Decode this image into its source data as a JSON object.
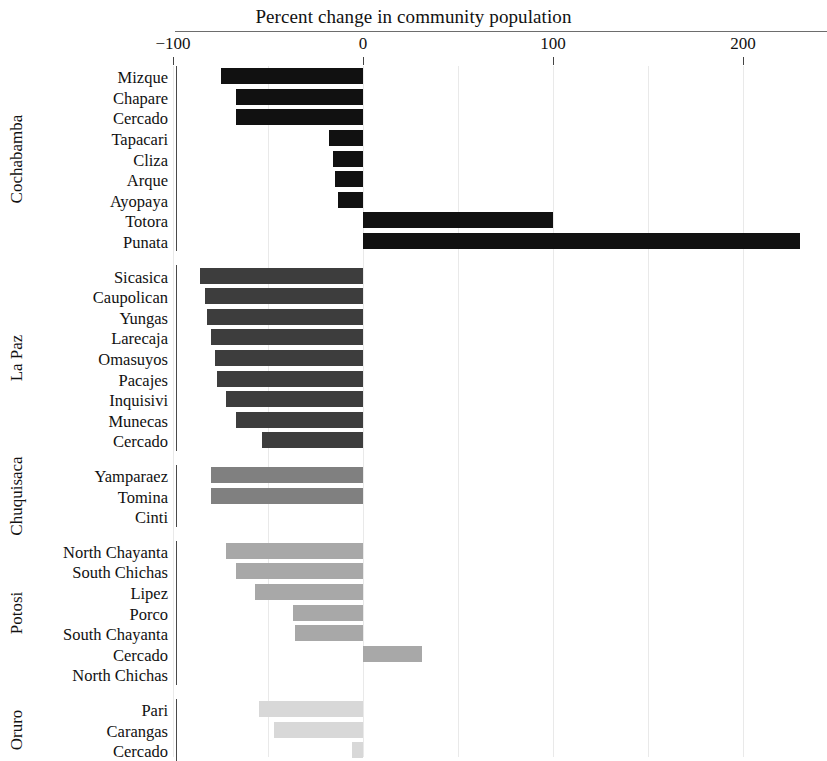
{
  "chart_data": {
    "type": "bar",
    "orientation": "horizontal",
    "title": "Percent change in community population",
    "xlabel": "",
    "ylabel": "",
    "xlim": [
      -100,
      240
    ],
    "xticks": [
      -100,
      0,
      100,
      200
    ],
    "xtick_labels": [
      "−100",
      "0",
      "100",
      "200"
    ],
    "grid": true,
    "grid_axis": "x",
    "legend": "none",
    "groups": [
      {
        "name": "Cochabamba",
        "color": "#111111",
        "categories": [
          "Mizque",
          "Chapare",
          "Cercado",
          "Tapacari",
          "Cliza",
          "Arque",
          "Ayopaya",
          "Totora",
          "Punata"
        ],
        "values": [
          -75,
          -67,
          -67,
          -18,
          -16,
          -15,
          -13,
          100,
          230
        ]
      },
      {
        "name": "La Paz",
        "color": "#3d3d3d",
        "categories": [
          "Sicasica",
          "Caupolican",
          "Yungas",
          "Larecaja",
          "Omasuyos",
          "Pacajes",
          "Inquisivi",
          "Munecas",
          "Cercado"
        ],
        "values": [
          -86,
          -83,
          -82,
          -80,
          -78,
          -77,
          -72,
          -67,
          -53
        ]
      },
      {
        "name": "Chuquisaca",
        "color": "#808080",
        "categories": [
          "Yamparaez",
          "Tomina",
          "Cinti"
        ],
        "values": [
          -80,
          -80,
          0
        ]
      },
      {
        "name": "Potosi",
        "color": "#a8a8a8",
        "categories": [
          "North Chayanta",
          "South Chichas",
          "Lipez",
          "Porco",
          "South Chayanta",
          "Cercado",
          "North Chichas"
        ],
        "values": [
          -72,
          -67,
          -57,
          -37,
          -36,
          31,
          0
        ]
      },
      {
        "name": "Oruro",
        "color": "#d8d8d8",
        "categories": [
          "Pari",
          "Carangas",
          "Cercado"
        ],
        "values": [
          -55,
          -47,
          -6
        ]
      }
    ]
  }
}
